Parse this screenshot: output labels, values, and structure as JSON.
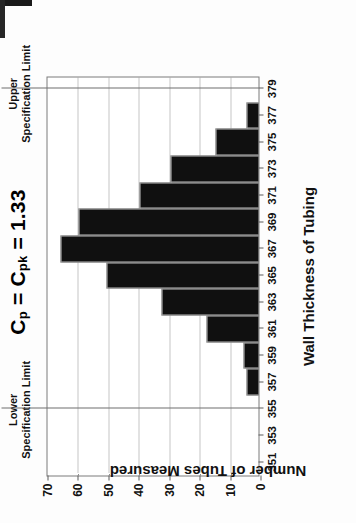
{
  "figure": {
    "title_parts": {
      "c1": "C",
      "sub1": "p",
      "eq1": " = ",
      "c2": "C",
      "sub2": "pk",
      "eq2": " = 1.33"
    },
    "title_text": "Cp = Cpk = 1.33"
  },
  "annotations": {
    "lower_limit": {
      "line1": "Lower",
      "line2": "Specification Limit",
      "value": 355
    },
    "upper_limit": {
      "line1": "Upper",
      "line2": "Specification Limit",
      "value": 379
    }
  },
  "axes": {
    "x_title": "Wall Thickness of Tubing",
    "y_title": "Number of Tubes Measured",
    "x_ticks": [
      351,
      353,
      355,
      357,
      359,
      361,
      363,
      365,
      367,
      369,
      371,
      373,
      375,
      377,
      379
    ],
    "y_ticks": [
      0,
      10,
      20,
      30,
      40,
      50,
      60,
      70
    ]
  },
  "chart_data": {
    "type": "bar",
    "title": "Cp = Cpk = 1.33",
    "xlabel": "Wall Thickness of Tubing",
    "ylabel": "Number of Tubes Measured",
    "orientation": "vertical",
    "grid": true,
    "legend": null,
    "xlim": [
      350,
      380
    ],
    "ylim": [
      0,
      70
    ],
    "categories": [
      357,
      359,
      361,
      363,
      365,
      367,
      369,
      371,
      373,
      375,
      377
    ],
    "values": [
      4,
      5,
      17,
      32,
      50,
      65,
      59,
      39,
      29,
      14,
      4
    ],
    "annotations": [
      {
        "label": "Lower Specification Limit",
        "x": 355
      },
      {
        "label": "Upper Specification Limit",
        "x": 379
      }
    ]
  },
  "colors": {
    "bar": "#101010",
    "grid": "#8d8d8d",
    "frame": "#7b7b7b",
    "speclimit": "#6f6f6f",
    "text": "#111111"
  }
}
